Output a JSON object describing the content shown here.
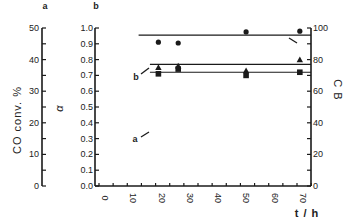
{
  "chart_data": {
    "type": "scatter",
    "title": "",
    "panel_labels": [
      "a",
      "b"
    ],
    "xlabel": "t / h",
    "xlim": [
      0,
      75
    ],
    "xticks": [
      0,
      10,
      20,
      30,
      40,
      50,
      60,
      70
    ],
    "axes": {
      "left_outer": {
        "label": "CO conv. %",
        "panel": "a",
        "ylim": [
          0,
          50
        ],
        "ticks": [
          0,
          10,
          20,
          30,
          40,
          50
        ]
      },
      "left_inner": {
        "label": "α",
        "panel": "b",
        "ylim": [
          0.0,
          1.0
        ],
        "ticks": [
          "0.0",
          "0.1",
          "0.2",
          "0.3",
          "0.4",
          "0.5",
          "0.6",
          "0.7",
          "0.8",
          "0.9",
          "1.0"
        ]
      },
      "right": {
        "label": "C B",
        "ylim": [
          0,
          100
        ],
        "ticks": [
          0,
          20,
          40,
          60,
          80,
          100
        ]
      }
    },
    "grid": false,
    "series": [
      {
        "name": "CB",
        "marker": "circle",
        "axis": "right",
        "x": [
          21,
          28,
          52,
          71
        ],
        "values": [
          91,
          90.5,
          97.5,
          98
        ],
        "line_level": 95.5,
        "line_from": 14
      },
      {
        "name": "b (α)",
        "marker": "triangle",
        "axis": "left_inner",
        "x": [
          21,
          28,
          52,
          71
        ],
        "values": [
          0.75,
          0.76,
          0.73,
          0.8
        ],
        "line_level": 0.77,
        "line_from": 18,
        "annotation": "b"
      },
      {
        "name": "a (CO conv. %)",
        "marker": "square",
        "axis": "left_outer",
        "x": [
          21,
          28,
          52,
          71
        ],
        "values": [
          35.5,
          37,
          35,
          36
        ],
        "line_level": 36,
        "line_from": 18,
        "annotation": "a"
      }
    ]
  },
  "labels": {
    "panel_a": "a",
    "panel_b": "b",
    "y_left_outer": "CO conv. %",
    "y_left_inner": "α",
    "y_right": "C B",
    "x_axis": "t / h",
    "annot_a": "a",
    "annot_b": "b"
  }
}
